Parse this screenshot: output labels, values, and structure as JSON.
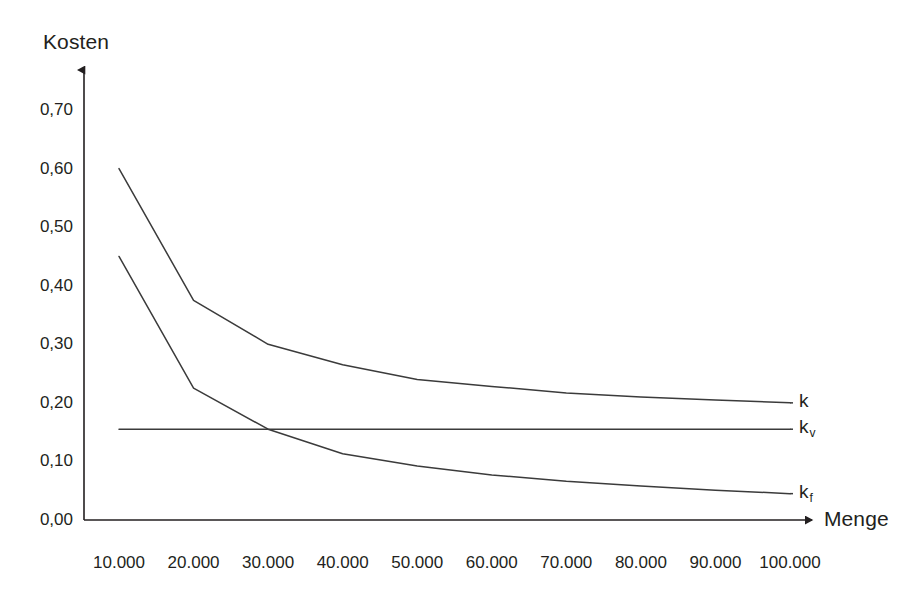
{
  "chart_data": {
    "type": "line",
    "title": "",
    "subtitle": "",
    "xlabel": "Menge",
    "ylabel": "Kosten",
    "grid": false,
    "legend_position": "right-inline",
    "x": [
      10000,
      20000,
      30000,
      40000,
      50000,
      60000,
      70000,
      80000,
      90000,
      100000
    ],
    "x_tick_labels": [
      "10.000",
      "20.000",
      "30.000",
      "40.000",
      "50.000",
      "60.000",
      "70.000",
      "80.000",
      "90.000",
      "100.000"
    ],
    "xlim": [
      10000,
      100000
    ],
    "y_tick_labels": [
      "0,00",
      "0,10",
      "0,20",
      "0,30",
      "0,40",
      "0,50",
      "0,60",
      "0,70"
    ],
    "y_ticks": [
      0.0,
      0.1,
      0.2,
      0.3,
      0.4,
      0.5,
      0.6,
      0.7
    ],
    "ylim": [
      0.0,
      0.7
    ],
    "series": [
      {
        "name": "k",
        "label": "k",
        "label_sub": "",
        "color": "#3b3b3b",
        "values": [
          0.6,
          0.375,
          0.3,
          0.265,
          0.24,
          0.228,
          0.217,
          0.21,
          0.205,
          0.2
        ]
      },
      {
        "name": "k_v",
        "label": "k",
        "label_sub": "v",
        "color": "#3b3b3b",
        "values": [
          0.155,
          0.155,
          0.155,
          0.155,
          0.155,
          0.155,
          0.155,
          0.155,
          0.155,
          0.155
        ]
      },
      {
        "name": "k_f",
        "label": "k",
        "label_sub": "f",
        "color": "#3b3b3b",
        "values": [
          0.45,
          0.225,
          0.155,
          0.113,
          0.092,
          0.077,
          0.066,
          0.058,
          0.051,
          0.045
        ]
      }
    ]
  },
  "axes": {
    "y_title": "Kosten",
    "x_title": "Menge"
  },
  "colors": {
    "line": "#3b3b3b",
    "axis": "#231f20",
    "background": "#ffffff",
    "text": "#231f20"
  }
}
